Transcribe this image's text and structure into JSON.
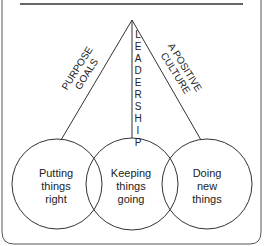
{
  "diagram": {
    "apex_label": "LEADERSHIP",
    "left_branch": {
      "line1": "PURPOSE",
      "line2": "GOALS"
    },
    "right_branch": {
      "line1": "A POSITIVE",
      "line2": "CULTURE"
    },
    "circles": [
      {
        "line1": "Putting",
        "line2": "things",
        "line3": "right"
      },
      {
        "line1": "Keeping",
        "line2": "things",
        "line3": "going"
      },
      {
        "line1": "Doing",
        "line2": "new",
        "line3": "things"
      }
    ],
    "colors": {
      "stroke": "#333333",
      "text": "#222222",
      "background": "#ffffff"
    }
  }
}
